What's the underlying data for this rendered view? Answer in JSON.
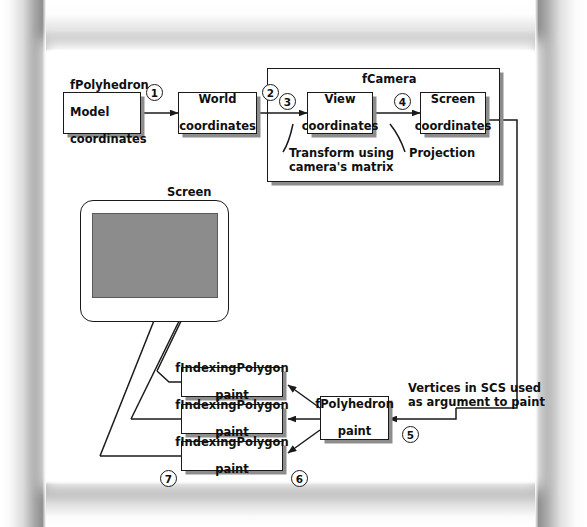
{
  "groups": {
    "camera_label": "fCamera",
    "screen_label": "Screen"
  },
  "boxes": [
    {
      "id": "model",
      "lines": [
        "fPolyhedron",
        "Model",
        "coordinates"
      ]
    },
    {
      "id": "world",
      "lines": [
        "World",
        "coordinates"
      ]
    },
    {
      "id": "view",
      "lines": [
        "View",
        "coordinates"
      ]
    },
    {
      "id": "screen",
      "lines": [
        "Screen",
        "coordinates"
      ]
    },
    {
      "id": "poly1",
      "lines": [
        "fIndexingPolygon",
        "paint"
      ]
    },
    {
      "id": "poly2",
      "lines": [
        "fIndexingPolygon",
        "paint"
      ]
    },
    {
      "id": "poly3",
      "lines": [
        "fIndexingPolygon",
        "paint"
      ]
    },
    {
      "id": "fpoly",
      "lines": [
        "fPolyhedron",
        "paint"
      ]
    }
  ],
  "annotations": [
    {
      "id": "transform",
      "lines": [
        "Transform using",
        "camera's matrix"
      ]
    },
    {
      "id": "projection",
      "lines": [
        "Projection"
      ]
    },
    {
      "id": "vertices",
      "lines": [
        "Vertices in SCS used",
        "as argument to paint"
      ]
    }
  ],
  "step_numbers": [
    "1",
    "2",
    "3",
    "4",
    "5",
    "6",
    "7"
  ],
  "colors": {
    "line": "#1a1a1a",
    "box_fill": "#ffffff",
    "box_shadow": "#8d8d8d",
    "screen_fill": "#8c8c8c",
    "cube_top": "#d3d3d3",
    "cube_side": "#b4b4b4",
    "cube_front": "#c4c4c4",
    "page_edge": "#9a9a9a"
  }
}
